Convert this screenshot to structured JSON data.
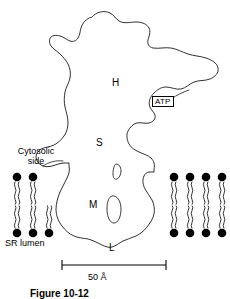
{
  "figure": {
    "caption": "Figure 10-12",
    "scale_bar": {
      "label": "50 Å",
      "value": 50,
      "unit": "Å"
    }
  },
  "labels": {
    "domain_H": "H",
    "domain_S": "S",
    "domain_M": "M",
    "domain_L": "L",
    "atp": "ATP",
    "cytosolic_side": "Cytosolic\nside",
    "cytosolic_side_line1": "Cytosolic",
    "cytosolic_side_line2": "side",
    "sr_lumen": "SR lumen"
  },
  "membrane": {
    "left_leaflet_outer_count": 2,
    "left_leaflet_inner_count": 3,
    "right_leaflet_outer_count": 4,
    "right_leaflet_inner_count": 4,
    "head_color": "#000000",
    "tail_color": "#000000"
  },
  "colors": {
    "outline": "#1a1a1a",
    "background": "#ffffff",
    "text": "#000000"
  }
}
